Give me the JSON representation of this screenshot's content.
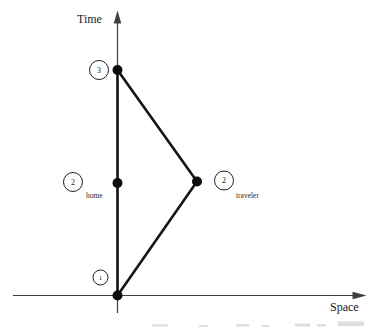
{
  "figure": {
    "type": "spacetime-diagram",
    "background": "#ffffff",
    "axes": {
      "vertical_label": "Time",
      "horizontal_label": "Space"
    },
    "events": {
      "departure": {
        "number": "1"
      },
      "home_midpoint": {
        "number": "2",
        "sublabel": "home"
      },
      "traveler_turnaround": {
        "number": "2",
        "sublabel": "traveler"
      },
      "reunion": {
        "number": "3"
      }
    },
    "colors": {
      "worldline": "#141414",
      "axis": "#3f3f3f",
      "outline": "#1f1f1f",
      "dot": "#0d0d0d",
      "smudge": "#9a9a9a"
    }
  }
}
